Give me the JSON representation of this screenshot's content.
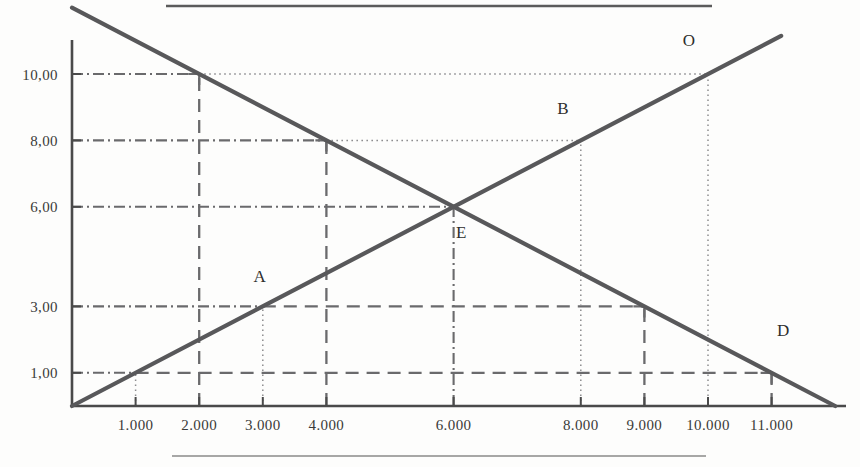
{
  "figure": {
    "title": "",
    "rules": {
      "top_rule": "horizontal-rule-top",
      "bottom_rule": "horizontal-rule-bottom"
    },
    "colors": {
      "line": "#58585a",
      "axis": "#4a4a4a",
      "guide_dash": "#6a6a6c",
      "guide_dot": "#8d8d8f",
      "text": "#33332f",
      "background": "#fdfdfc"
    }
  },
  "chart_data": {
    "type": "line",
    "title": "",
    "xlabel": "",
    "ylabel": "",
    "xlim": [
      0,
      12.2
    ],
    "ylim": [
      0,
      12.2
    ],
    "grid": false,
    "legend": null,
    "x_tick_labels": [
      "1.000",
      "2.000",
      "3.000",
      "4.000",
      "6.000",
      "8.000",
      "9.000",
      "10.000",
      "11.000"
    ],
    "x_tick_values": [
      1,
      2,
      3,
      4,
      6,
      8,
      9,
      10,
      11
    ],
    "y_tick_labels": [
      "10,00",
      "8,00",
      "6,00",
      "3,00",
      "1,00"
    ],
    "y_tick_values": [
      10,
      8,
      6,
      3,
      1
    ],
    "series": [
      {
        "name": "demand",
        "type": "line",
        "x": [
          0,
          12
        ],
        "y": [
          12,
          0
        ]
      },
      {
        "name": "supply",
        "type": "line",
        "x": [
          0,
          11.15
        ],
        "y": [
          0,
          11.15
        ]
      }
    ],
    "points": [
      {
        "label": "A",
        "x": 3,
        "y": 3,
        "label_dx": -0.05,
        "label_dy": 0.75
      },
      {
        "label": "E",
        "x": 6,
        "y": 6,
        "label_dx": 0.12,
        "label_dy": -0.95
      },
      {
        "label": "B",
        "x": 8,
        "y": 8,
        "label_dx": -0.28,
        "label_dy": 0.8
      },
      {
        "label": "O",
        "x": 10,
        "y": 10,
        "label_dx": -0.3,
        "label_dy": 0.85
      },
      {
        "label": "D",
        "x": 11,
        "y": 1,
        "label_dx": 0.18,
        "label_dy": 1.1
      }
    ],
    "guide_lines": [
      {
        "name": "h-10",
        "style": "dash-dot",
        "x0": 0,
        "x1": 2,
        "y0": 10,
        "y1": 10
      },
      {
        "name": "h-10-dotted",
        "style": "dotted",
        "x0": 2,
        "x1": 10,
        "y0": 10,
        "y1": 10
      },
      {
        "name": "v-2",
        "style": "dashed",
        "x0": 2,
        "x1": 2,
        "y0": 0,
        "y1": 10
      },
      {
        "name": "h-8",
        "style": "dash-dot",
        "x0": 0,
        "x1": 4,
        "y0": 8,
        "y1": 8
      },
      {
        "name": "h-8-dotted",
        "style": "dotted",
        "x0": 4,
        "x1": 8,
        "y0": 8,
        "y1": 8
      },
      {
        "name": "v-4",
        "style": "dashed",
        "x0": 4,
        "x1": 4,
        "y0": 0,
        "y1": 8
      },
      {
        "name": "h-6",
        "style": "dash-dot",
        "x0": 0,
        "x1": 6,
        "y0": 6,
        "y1": 6
      },
      {
        "name": "v-6",
        "style": "dash-dot",
        "x0": 6,
        "x1": 6,
        "y0": 0,
        "y1": 6
      },
      {
        "name": "h-3",
        "style": "dash-dot",
        "x0": 0,
        "x1": 3,
        "y0": 3,
        "y1": 3
      },
      {
        "name": "h-3-dashed",
        "style": "dashed",
        "x0": 3,
        "x1": 9,
        "y0": 3,
        "y1": 3
      },
      {
        "name": "v-9",
        "style": "dashed",
        "x0": 9,
        "x1": 9,
        "y0": 0,
        "y1": 3
      },
      {
        "name": "h-1",
        "style": "dash-dot",
        "x0": 0,
        "x1": 1,
        "y0": 1,
        "y1": 1
      },
      {
        "name": "h-1-dashed",
        "style": "dashed",
        "x0": 1,
        "x1": 11,
        "y0": 1,
        "y1": 1
      },
      {
        "name": "v-11",
        "style": "dashed",
        "x0": 11,
        "x1": 11,
        "y0": 0,
        "y1": 1
      },
      {
        "name": "v-1-dot",
        "style": "dotted",
        "x0": 1,
        "x1": 1,
        "y0": 0,
        "y1": 1
      },
      {
        "name": "v-3-dot",
        "style": "dotted",
        "x0": 3,
        "x1": 3,
        "y0": 0,
        "y1": 3
      },
      {
        "name": "v-8-dot",
        "style": "dotted",
        "x0": 8,
        "x1": 8,
        "y0": 0,
        "y1": 8
      },
      {
        "name": "v-10-dot",
        "style": "dotted",
        "x0": 10,
        "x1": 10,
        "y0": 0,
        "y1": 10
      }
    ]
  }
}
